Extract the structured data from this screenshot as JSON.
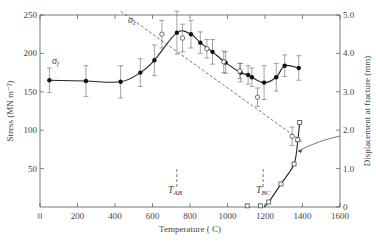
{
  "chart_data": {
    "type": "line",
    "title": "",
    "xlabel": "Temperature (°C)",
    "ylabel_left": "Stress (MN m⁻²)",
    "ylabel_right": "Displacement at fracture (mm)",
    "xlim": [
      0,
      1600
    ],
    "ylim_left": [
      0,
      250
    ],
    "ylim_right": [
      0,
      5.0
    ],
    "x_ticks": [
      "0",
      "200",
      "400",
      "600",
      "800",
      "1000",
      "1200",
      "1400",
      "1600"
    ],
    "y_ticks_left": [
      "50",
      "100",
      "150",
      "200",
      "250"
    ],
    "y_ticks_right": [
      "0",
      "1.0",
      "2.0",
      "3.0",
      "4.0",
      "5.0"
    ],
    "grid": false,
    "annotations": [
      {
        "text": "σf",
        "label": "sigma_f"
      },
      {
        "text": "σc",
        "label": "sigma_c"
      },
      {
        "text": "TAB",
        "x": 730
      },
      {
        "text": "TBC",
        "x": 1190
      }
    ],
    "series": [
      {
        "name": "σf (fracture stress, filled circles)",
        "axis": "left",
        "marker": "filled-circle",
        "x": [
          50,
          245,
          430,
          535,
          610,
          730,
          805,
          855,
          920,
          990,
          1070,
          1110,
          1130,
          1195,
          1260,
          1305,
          1380
        ],
        "values": [
          165,
          164,
          163,
          175,
          191,
          227,
          225,
          214,
          202,
          188,
          175,
          172,
          169,
          162,
          169,
          184,
          181
        ],
        "error": [
          16,
          20,
          21,
          18,
          20,
          28,
          18,
          14,
          16,
          14,
          12,
          12,
          12,
          22,
          18,
          14,
          16
        ]
      },
      {
        "name": "σc (open circles, dashed)",
        "axis": "left",
        "marker": "open-circle",
        "x": [
          650,
          760,
          890,
          980,
          1065,
          1160,
          1345
        ],
        "values": [
          225,
          220,
          206,
          189,
          177,
          143,
          92
        ],
        "error": [
          18,
          18,
          12,
          14,
          10,
          12,
          12
        ]
      },
      {
        "name": "Displacement at fracture (open squares)",
        "axis": "right",
        "marker": "open-square",
        "x": [
          1105,
          1175,
          1220,
          1285,
          1355,
          1375,
          1385
        ],
        "values": [
          0.03,
          0.03,
          0.13,
          0.6,
          1.12,
          1.75,
          2.2
        ]
      }
    ]
  },
  "labels": {
    "sigma_f": "σ",
    "sigma_f_sub": "f",
    "sigma_c": "σ",
    "sigma_c_sub": "c",
    "t_ab": "T",
    "t_ab_sub": "AB",
    "t_bc": "T",
    "t_bc_sub": "BC",
    "xlabel": "Temperature ( C)",
    "ylabel_left": "Stress (MN m⁻²)",
    "ylabel_right": "Displacement at fracture (mm)"
  }
}
